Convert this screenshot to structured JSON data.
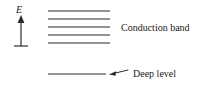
{
  "figure": {
    "background_color": "#ffffff",
    "ink_color": "#2a2a2a",
    "width": 210,
    "height": 91
  },
  "axis": {
    "label": "E",
    "name": "energy-axis",
    "direction": "up",
    "arrow_tip_y": 16,
    "arrow_base_y": 46,
    "arrow_x": 21,
    "base_tick_half_width": 7
  },
  "conduction_band": {
    "label": "Conduction band",
    "line_count": 5,
    "line_x_start": 48,
    "line_x_end": 110,
    "line_y_positions": [
      11,
      19,
      27,
      35,
      43
    ],
    "label_x": 121,
    "label_y": 28
  },
  "deep_level": {
    "label": "Deep level",
    "line_count": 1,
    "line_x_start": 48,
    "line_x_end": 106,
    "line_y": 74,
    "leader": {
      "tip_x": 110,
      "tip_y": 74,
      "tail_x": 128,
      "tail_y": 70
    },
    "label_x": 134,
    "label_y": 76
  }
}
